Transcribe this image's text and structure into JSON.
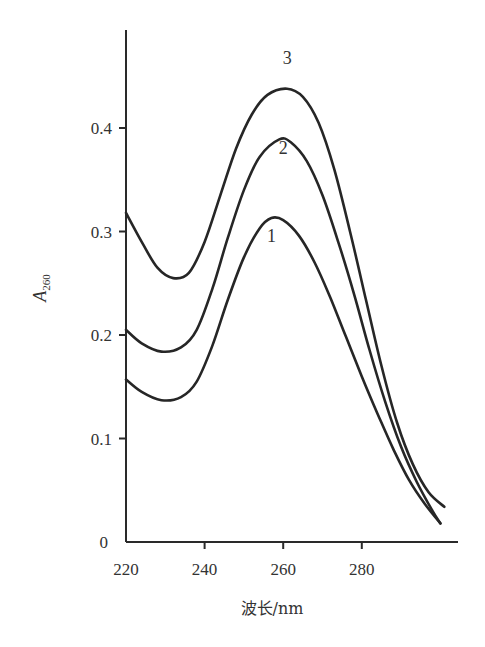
{
  "chart_data": {
    "type": "line",
    "title": "",
    "xlabel": "波长/nm",
    "ylabel": "A260",
    "ylabel_main": "A",
    "ylabel_sub": "260",
    "xlim": [
      220,
      303
    ],
    "ylim": [
      0,
      0.48
    ],
    "grid": false,
    "legend": "inline curve labels",
    "x_ticks": [
      220,
      240,
      260,
      280
    ],
    "x_tick_labels": [
      "220",
      "240",
      "260",
      "280"
    ],
    "y_ticks": [
      0,
      0.1,
      0.2,
      0.3,
      0.4
    ],
    "y_tick_labels": [
      "0",
      "0.1",
      "0.2",
      "0.3",
      "0.4"
    ],
    "series": [
      {
        "name": "1",
        "label_pos": [
          257,
          0.29
        ],
        "x": [
          220,
          224,
          229,
          234,
          238,
          242,
          246,
          250,
          254,
          257,
          260,
          264,
          268,
          272,
          276,
          280,
          284,
          288,
          292,
          296,
          300
        ],
        "y": [
          0.157,
          0.145,
          0.137,
          0.14,
          0.155,
          0.19,
          0.235,
          0.275,
          0.303,
          0.313,
          0.311,
          0.296,
          0.27,
          0.236,
          0.198,
          0.16,
          0.124,
          0.09,
          0.06,
          0.037,
          0.018
        ]
      },
      {
        "name": "2",
        "label_pos": [
          260,
          0.375
        ],
        "x": [
          220,
          224,
          229,
          234,
          238,
          242,
          246,
          250,
          254,
          259,
          262,
          266,
          270,
          274,
          278,
          282,
          286,
          290,
          294,
          298,
          300
        ],
        "y": [
          0.205,
          0.192,
          0.184,
          0.188,
          0.205,
          0.245,
          0.295,
          0.34,
          0.372,
          0.389,
          0.386,
          0.368,
          0.335,
          0.29,
          0.24,
          0.185,
          0.135,
          0.092,
          0.058,
          0.03,
          0.018
        ]
      },
      {
        "name": "3",
        "label_pos": [
          261,
          0.462
        ],
        "x": [
          220,
          224,
          228,
          232,
          236,
          240,
          244,
          248,
          252,
          256,
          261,
          265,
          269,
          273,
          277,
          281,
          285,
          289,
          293,
          297,
          301
        ],
        "y": [
          0.318,
          0.29,
          0.265,
          0.255,
          0.26,
          0.29,
          0.335,
          0.38,
          0.413,
          0.432,
          0.438,
          0.43,
          0.405,
          0.36,
          0.3,
          0.235,
          0.17,
          0.115,
          0.075,
          0.048,
          0.034
        ]
      }
    ]
  },
  "layout": {
    "origin_px": [
      126,
      542
    ],
    "x_px_per_unit": 3.93,
    "y_px_per_unit": 1035,
    "y_axis_top_px": 30,
    "x_axis_right_px": 458
  }
}
